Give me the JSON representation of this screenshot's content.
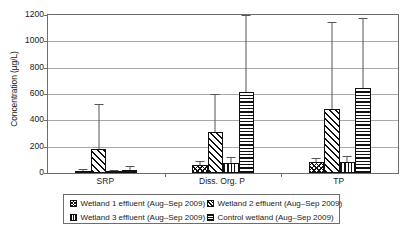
{
  "chart_data": {
    "type": "bar",
    "title": "",
    "xlabel": "",
    "ylabel": "Concentration (µg/L)",
    "ylim": [
      0,
      1200
    ],
    "ytick_step": 200,
    "yticks": [
      "0",
      "200",
      "400",
      "600",
      "800",
      "1000",
      "1200"
    ],
    "grid": true,
    "legend_position": "bottom",
    "error_bars": "upper-only",
    "categories": [
      "SRP",
      "Diss. Org. P",
      "TP"
    ],
    "series": [
      {
        "name": "Wetland 1 effluent (Aug–Sep 2009)",
        "pattern": "crosshatch",
        "values": [
          18,
          60,
          85
        ],
        "errors_upper": [
          30,
          90,
          115
        ]
      },
      {
        "name": "Wetland 2 effluent (Aug–Sep 2009)",
        "pattern": "diagonal",
        "values": [
          180,
          310,
          485
        ],
        "errors_upper": [
          525,
          600,
          1145
        ]
      },
      {
        "name": "Wetland 3 effluent (Aug–Sep 2009)",
        "pattern": "vertical",
        "values": [
          15,
          75,
          85
        ],
        "errors_upper": [
          22,
          118,
          130
        ]
      },
      {
        "name": "Control wetland (Aug–Sep 2009)",
        "pattern": "horizontal",
        "values": [
          20,
          615,
          645
        ],
        "errors_upper": [
          50,
          1200,
          1180
        ]
      }
    ]
  },
  "legend": {
    "items": [
      {
        "label": "Wetland 1 effluent (Aug–Sep 2009)",
        "pattern": "crosshatch"
      },
      {
        "label": "Wetland 2 effluent (Aug–Sep 2009)",
        "pattern": "diagonal"
      },
      {
        "label": "Wetland 3 effluent (Aug–Sep 2009)",
        "pattern": "vertical"
      },
      {
        "label": "Control wetland (Aug–Sep 2009)",
        "pattern": "horizontal"
      }
    ]
  }
}
